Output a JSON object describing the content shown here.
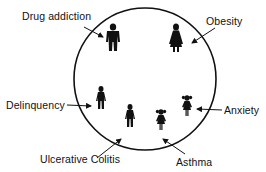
{
  "diagram": {
    "type": "circle-with-figures",
    "circle": {
      "cx": 145,
      "cy": 79,
      "r": 71,
      "stroke": "#111111"
    },
    "colors": {
      "ink": "#111111",
      "background": "#ffffff"
    },
    "labels": {
      "drug_addiction": "Drug addiction",
      "obesity": "Obesity",
      "delinquency": "Delinquency",
      "anxiety": "Anxiety",
      "ulcerative_colitis": "Ulcerative Colitis",
      "asthma": "Asthma"
    },
    "figures": [
      {
        "id": "drug-addiction",
        "kind": "man",
        "x": 113,
        "y": 27
      },
      {
        "id": "obesity",
        "kind": "woman",
        "x": 176,
        "y": 27
      },
      {
        "id": "delinquency",
        "kind": "boy",
        "x": 101,
        "y": 89
      },
      {
        "id": "ulcerative-colitis",
        "kind": "boy",
        "x": 130,
        "y": 107
      },
      {
        "id": "anxiety",
        "kind": "girl",
        "x": 187,
        "y": 98
      },
      {
        "id": "asthma",
        "kind": "girl",
        "x": 161,
        "y": 112
      }
    ]
  }
}
